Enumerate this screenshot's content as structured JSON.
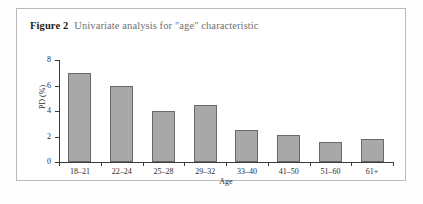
{
  "figure": {
    "caption_label": "Figure 2",
    "caption_text": "Univariate analysis for \"age\" characteristic"
  },
  "chart_data": {
    "type": "bar",
    "title": "Univariate analysis for \"age\" characteristic",
    "xlabel": "Age",
    "ylabel": "PD (%)",
    "categories": [
      "18–21",
      "22–24",
      "25–28",
      "29–32",
      "33–40",
      "41–50",
      "51–60",
      "61+"
    ],
    "values": [
      7.0,
      6.0,
      4.0,
      4.5,
      2.5,
      2.1,
      1.6,
      1.8
    ],
    "ylim": [
      0,
      8
    ],
    "yticks": [
      0,
      2,
      4,
      6,
      8
    ],
    "ytick_labels": [
      "0",
      "2",
      "4",
      "6",
      "8"
    ],
    "grid": false,
    "legend": false,
    "bar_color": "#a8a8a8",
    "bar_edge_color": "#6a6a6a",
    "axis_color": "#3a3a3a"
  }
}
